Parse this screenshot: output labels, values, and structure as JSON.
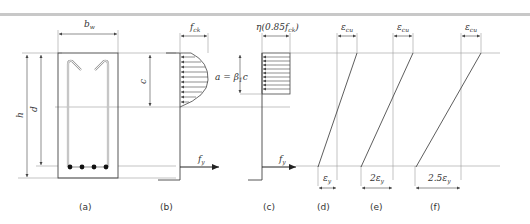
{
  "figure": {
    "colors": {
      "line": "#444444",
      "guide": "#9a9a9a",
      "band": "#c8c8c8",
      "text": "#333333"
    },
    "section_a": {
      "label": "(a)",
      "width_dim": "b",
      "width_sub": "w",
      "height_dim": "h",
      "depth_dim": "d",
      "rebar_count": 4
    },
    "section_b": {
      "label": "(b)",
      "stress_label": "f",
      "stress_sub": "ck",
      "depth_dim": "c",
      "steel_force": "f",
      "steel_sub": "y"
    },
    "section_c": {
      "label": "(c)",
      "stress_label": "η(0.85f",
      "stress_sub": "ck",
      "stress_close": ")",
      "block_dim": "a = β",
      "block_sub": "1",
      "block_tail": "c",
      "steel_force": "f",
      "steel_sub": "y"
    },
    "strain_d": {
      "label": "(d)",
      "top": "ε",
      "top_sub": "cu",
      "bottom_coef": "",
      "bottom": "ε",
      "bottom_sub": "y"
    },
    "strain_e": {
      "label": "(e)",
      "top": "ε",
      "top_sub": "cu",
      "bottom_coef": "2",
      "bottom": "ε",
      "bottom_sub": "y"
    },
    "strain_f": {
      "label": "(f)",
      "top": "ε",
      "top_sub": "cu",
      "bottom_coef": "2.5",
      "bottom": "ε",
      "bottom_sub": "y"
    }
  }
}
